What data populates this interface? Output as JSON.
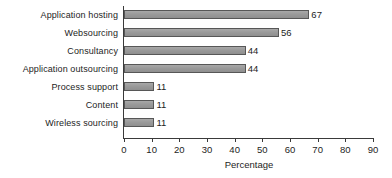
{
  "chart_data": {
    "type": "bar",
    "orientation": "horizontal",
    "title": "",
    "xlabel": "Percentage",
    "ylabel": "",
    "categories": [
      "Application hosting",
      "Websourcing",
      "Consultancy",
      "Application outsourcing",
      "Process support",
      "Content",
      "Wireless sourcing"
    ],
    "values": [
      67,
      56,
      44,
      44,
      11,
      11,
      11
    ],
    "data_labels": [
      "67",
      "56",
      "44",
      "44",
      "11",
      "11",
      "11"
    ],
    "xlim": [
      0,
      90
    ],
    "xticks": [
      0,
      10,
      20,
      30,
      40,
      50,
      60,
      70,
      80,
      90
    ],
    "xtick_labels": [
      "0",
      "10",
      "20",
      "30",
      "40",
      "50",
      "60",
      "70",
      "80",
      "90"
    ],
    "grid": false,
    "legend": false,
    "colors": {
      "bar_fill": "#9c9c9c",
      "bar_border": "#575757",
      "axis": "#3a3a3a",
      "text": "#1d1d1d",
      "background": "#ffffff"
    }
  }
}
